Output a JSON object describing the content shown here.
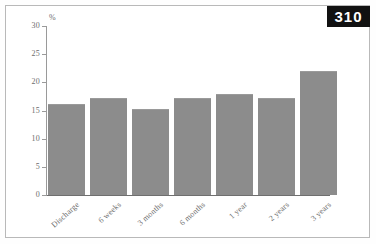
{
  "page": {
    "badge_number": "310"
  },
  "chart_data": {
    "type": "bar",
    "title": "",
    "xlabel": "",
    "ylabel": "%",
    "unit_label": "%",
    "categories": [
      "Discharge",
      "6 weeks",
      "3 months",
      "6 months",
      "1 year",
      "2 years",
      "3 years"
    ],
    "values": [
      16.2,
      17.2,
      15.2,
      17.2,
      18.0,
      17.2,
      22.0
    ],
    "ylim": [
      0,
      30
    ],
    "ytick_labels": [
      "0",
      "5",
      "10",
      "15",
      "20",
      "25",
      "30"
    ],
    "ytick_values": [
      0,
      5,
      10,
      15,
      20,
      25,
      30
    ],
    "grid": false,
    "legend": "none",
    "bar_color": "#8c8c8c",
    "axis_color": "#9a9a9a",
    "text_color": "#6d6d6d"
  }
}
